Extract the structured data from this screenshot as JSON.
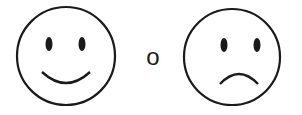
{
  "faces": [
    {
      "name": "happy-face",
      "expression": "smile"
    },
    {
      "name": "sad-face",
      "expression": "frown"
    }
  ],
  "connector": "o",
  "stroke_color": "#1a1a1a"
}
